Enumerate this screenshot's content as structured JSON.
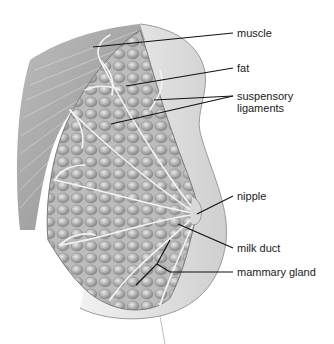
{
  "figure": {
    "labels": [
      {
        "id": "muscle",
        "text": "muscle",
        "x": 237,
        "y": 27
      },
      {
        "id": "fat",
        "text": "fat",
        "x": 237,
        "y": 62
      },
      {
        "id": "suspensory-ligaments",
        "text": "suspensory\nligaments",
        "x": 237,
        "y": 90
      },
      {
        "id": "nipple",
        "text": "nipple",
        "x": 237,
        "y": 190
      },
      {
        "id": "milk-duct",
        "text": "milk duct",
        "x": 237,
        "y": 242
      },
      {
        "id": "mammary-gland",
        "text": "mammary gland",
        "x": 237,
        "y": 266
      }
    ],
    "colors": {
      "background": "#ffffff",
      "tissue": "#c9c9c9",
      "skin": "#e4e4e4",
      "muscle": "#a8a8a8",
      "leader": "#111111"
    }
  }
}
